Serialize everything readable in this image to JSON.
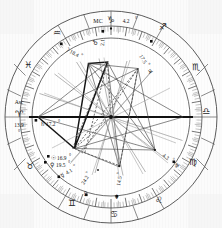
{
  "chart": {
    "type": "astrological-natal-chart",
    "center": {
      "x": 111,
      "y": 117
    },
    "radii": {
      "outer": 108,
      "sign_ring_inner": 92,
      "degree_ring_inner": 80,
      "house_field": 78
    },
    "rotation_note": "Ascendant at left (9 o'clock), zodiac counterclockwise"
  },
  "axes": {
    "ascendant": {
      "abbr": "Asc",
      "sign_glyph": "♈",
      "sign_name": "Aries",
      "degree": "13.9",
      "degree_unit": "°"
    },
    "midheaven": {
      "abbr": "MC",
      "sign_glyph": "♑",
      "sign_name": "Capricorn",
      "degree": "4.2",
      "degree_unit": "°",
      "label": "MC ♑ 4.2°"
    }
  },
  "signs": [
    {
      "name": "Aries",
      "glyph": "♈",
      "abbr": "Ari"
    },
    {
      "name": "Taurus",
      "glyph": "♉",
      "abbr": "Tau"
    },
    {
      "name": "Gemini",
      "glyph": "♊",
      "abbr": "Gem"
    },
    {
      "name": "Cancer",
      "glyph": "♋",
      "abbr": "Can"
    },
    {
      "name": "Leo",
      "glyph": "♌",
      "abbr": "Leo"
    },
    {
      "name": "Virgo",
      "glyph": "♍",
      "abbr": "Vir"
    },
    {
      "name": "Libra",
      "glyph": "♎",
      "abbr": "Lib"
    },
    {
      "name": "Scorpio",
      "glyph": "♏",
      "abbr": "Sco"
    },
    {
      "name": "Sagittarius",
      "glyph": "♐",
      "abbr": "Sag"
    },
    {
      "name": "Capricorn",
      "glyph": "♑",
      "abbr": "Cap"
    },
    {
      "name": "Aquarius",
      "glyph": "♒",
      "abbr": "Aqu"
    },
    {
      "name": "Pisces",
      "glyph": "♓",
      "abbr": "Pis"
    }
  ],
  "planets": [
    {
      "name": "Saturn",
      "glyph": "♄",
      "degree": "17.2",
      "label": "♄ 17.2°",
      "sign": "Aries"
    },
    {
      "name": "Sun",
      "glyph": "☉",
      "degree": "16.9",
      "label": "☉ 16.9°",
      "sign": "Taurus"
    },
    {
      "name": "Venus",
      "glyph": "♀",
      "degree": "19.5",
      "label": "♀ 19.5°",
      "sign": "Taurus"
    },
    {
      "name": "Mercury",
      "glyph": "☿",
      "degree": "4.1",
      "label": "☿ 4.1°",
      "sign": "Taurus"
    },
    {
      "name": "Pluto",
      "glyph": "♇",
      "degree": "24.2",
      "label": "♇ 24.2°",
      "sign": "Gemini"
    },
    {
      "name": "Neptune",
      "glyph": "♆",
      "degree": "14.5",
      "label": "♆ 14.5°",
      "sign": "Cancer"
    },
    {
      "name": "Uranus",
      "glyph": "♅",
      "degree": "4.3",
      "label": "♅ 4.3°",
      "sign": "Scorpio"
    },
    {
      "name": "Jupiter",
      "glyph": "♃",
      "degree": "17.5",
      "label": "♃ 17.5°",
      "sign": "Sagittarius"
    },
    {
      "name": "Moon",
      "glyph": "☽",
      "degree": "18.4",
      "label": "☽ 18.4°",
      "sign": "Aquarius"
    },
    {
      "name": "Mars",
      "glyph": "♂",
      "degree": "2.1",
      "label": "♂ 2.1°",
      "sign": "Capricorn"
    }
  ],
  "chart_data": {
    "type": "scatter",
    "xlabel": "",
    "ylabel": "",
    "categories": [
      "Aries",
      "Taurus",
      "Gemini",
      "Cancer",
      "Leo",
      "Virgo",
      "Libra",
      "Scorpio",
      "Sagittarius",
      "Capricorn",
      "Aquarius",
      "Pisces"
    ],
    "series": [
      {
        "name": "Planet longitudes (sign + degree)",
        "points": [
          {
            "body": "Saturn",
            "sign": "Aries",
            "deg": 17.2
          },
          {
            "body": "Sun",
            "sign": "Taurus",
            "deg": 16.9
          },
          {
            "body": "Venus",
            "sign": "Taurus",
            "deg": 19.5
          },
          {
            "body": "Mercury",
            "sign": "Taurus",
            "deg": 4.1
          },
          {
            "body": "Pluto",
            "sign": "Gemini",
            "deg": 24.2
          },
          {
            "body": "Neptune",
            "sign": "Cancer",
            "deg": 14.5
          },
          {
            "body": "Uranus",
            "sign": "Scorpio",
            "deg": 4.3
          },
          {
            "body": "Jupiter",
            "sign": "Sagittarius",
            "deg": 17.5
          },
          {
            "body": "Moon",
            "sign": "Aquarius",
            "deg": 18.4
          },
          {
            "body": "Mars",
            "sign": "Capricorn",
            "deg": 2.1
          }
        ]
      },
      {
        "name": "Chart angles",
        "points": [
          {
            "body": "Ascendant",
            "sign": "Aries",
            "deg": 13.9
          },
          {
            "body": "Midheaven",
            "sign": "Capricorn",
            "deg": 4.2
          }
        ]
      }
    ],
    "grid": true,
    "legend_position": "none"
  },
  "colors": {
    "ink": "#141414",
    "ring_stroke": "#4a4a4a",
    "aspect_dark": "#2a2a2a",
    "aspect_light": "#9d9d9d",
    "background": "#fbfbfb"
  }
}
